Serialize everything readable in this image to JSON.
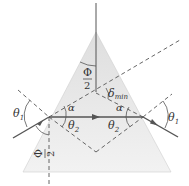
{
  "figure": {
    "type": "prism-minimum-deviation-diagram",
    "colors": {
      "prism_fill_top": "#e4e4e4",
      "prism_fill_bottom": "#f4f4f4",
      "ray": "#555555",
      "dashed": "#555555",
      "text": "#333333"
    }
  },
  "labels": {
    "theta1_left": "θ",
    "theta1_left_sub": "1",
    "theta1_right": "θ",
    "theta1_right_sub": "1",
    "theta2_left": "θ",
    "theta2_left_sub": "2",
    "theta2_right": "θ",
    "theta2_right_sub": "2",
    "alpha_left": "α",
    "alpha_right": "α",
    "phi_top_num": "Φ",
    "phi_top_den": "2",
    "phi_bottom_num": "Φ",
    "phi_bottom_den": "2",
    "delta": "δ",
    "delta_sub": "min"
  }
}
